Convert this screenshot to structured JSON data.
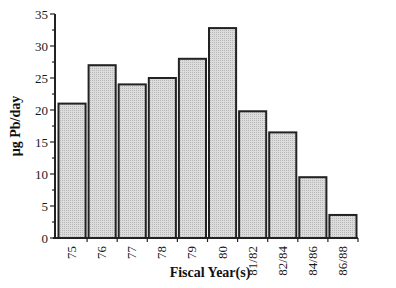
{
  "chart_data": {
    "type": "bar",
    "title": "",
    "xlabel": "Fiscal Year(s)",
    "ylabel": "µg Pb/day",
    "categories": [
      "75",
      "76",
      "77",
      "78",
      "79",
      "80",
      "81/82",
      "82/84",
      "84/86",
      "86/88"
    ],
    "values": [
      21,
      27,
      24,
      25,
      28,
      32.8,
      19.8,
      16.5,
      9.5,
      3.6
    ],
    "ylim": [
      0,
      35
    ],
    "yticks": [
      0,
      5,
      10,
      15,
      20,
      25,
      30,
      35
    ],
    "grid": false,
    "legend": null,
    "bar_fill": "#d4d4d4",
    "bar_stroke": "#222222"
  }
}
